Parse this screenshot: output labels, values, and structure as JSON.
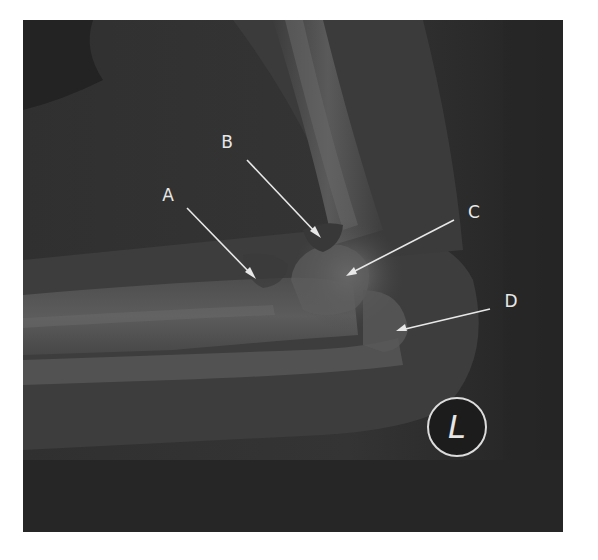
{
  "figure": {
    "side_marker": "L",
    "labels": [
      {
        "id": "A",
        "text": "A"
      },
      {
        "id": "B",
        "text": "B"
      },
      {
        "id": "C",
        "text": "C"
      },
      {
        "id": "D",
        "text": "D"
      }
    ],
    "colors": {
      "background": "#2b2b2b",
      "bone": "#8a8a8a",
      "soft_tissue": "#4a4a4a",
      "annotation": "#e8e8e8"
    }
  }
}
